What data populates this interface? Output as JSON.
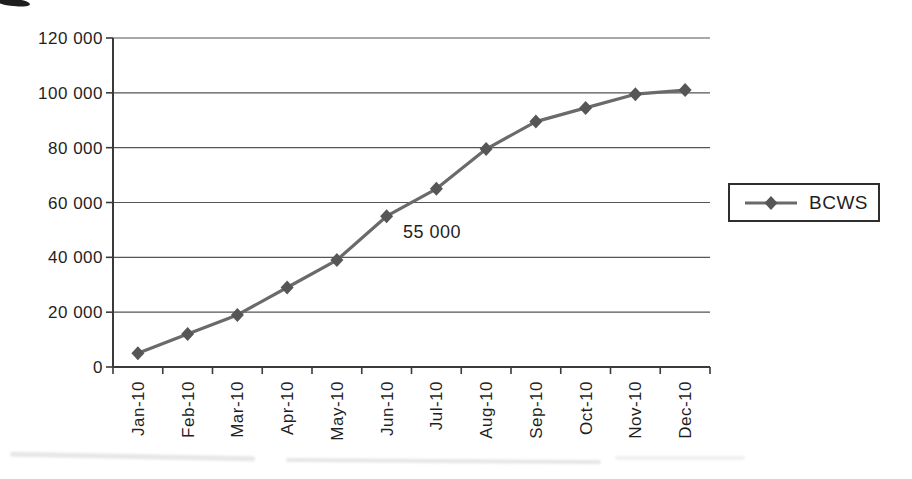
{
  "chart_data": {
    "type": "line",
    "title": "",
    "xlabel": "",
    "ylabel": "",
    "categories": [
      "Jan-10",
      "Feb-10",
      "Mar-10",
      "Apr-10",
      "May-10",
      "Jun-10",
      "Jul-10",
      "Aug-10",
      "Sep-10",
      "Oct-10",
      "Nov-10",
      "Dec-10"
    ],
    "series": [
      {
        "name": "BCWS",
        "values": [
          5000,
          12000,
          19000,
          29000,
          39000,
          55000,
          65000,
          79500,
          89500,
          94500,
          99500,
          101000
        ],
        "color": "#6a6a6a",
        "marker": "diamond",
        "marker_color": "#565656"
      }
    ],
    "y_axis": {
      "min": 0,
      "max": 120000,
      "step": 20000,
      "tick_labels": [
        "0",
        "20 000",
        "40 000",
        "60 000",
        "80 000",
        "100 000",
        "120 000"
      ]
    },
    "x_axis": {
      "label_rotation_deg": -90
    },
    "grid": true,
    "legend": {
      "position": "right",
      "entries": [
        "BCWS"
      ]
    },
    "annotation": {
      "text": "55 000",
      "category": "Jun-10",
      "value": 55000
    },
    "colors": {
      "axis": "#3a3a3a",
      "grid": "#555555",
      "text": "#1f1f1f",
      "background": "#ffffff"
    }
  }
}
